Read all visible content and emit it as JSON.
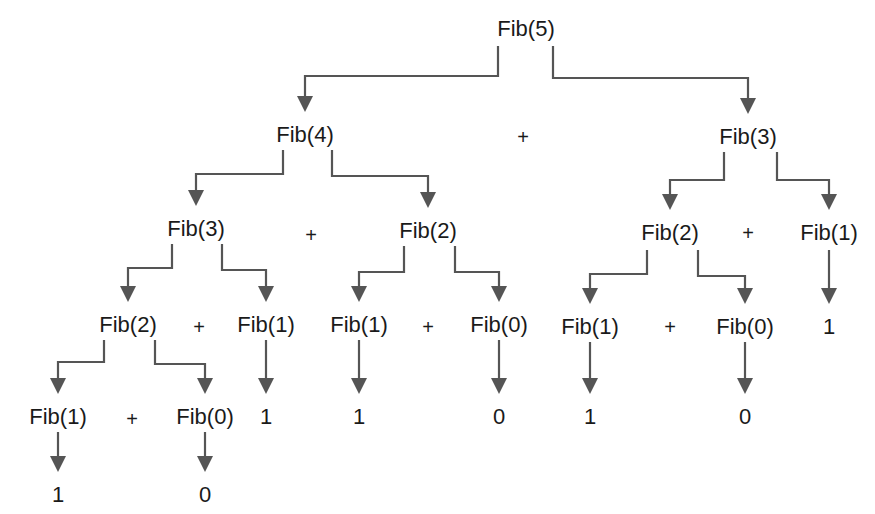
{
  "colors": {
    "text": "#1a1a1a",
    "arrow": "#555555",
    "background": "#ffffff"
  },
  "nodes": [
    {
      "id": "n5",
      "label": "Fib(5)",
      "x": 526,
      "y": 16
    },
    {
      "id": "n4",
      "label": "Fib(4)",
      "x": 305,
      "y": 122
    },
    {
      "id": "n3r",
      "label": "Fib(3)",
      "x": 748,
      "y": 124
    },
    {
      "id": "n3",
      "label": "Fib(3)",
      "x": 196,
      "y": 216
    },
    {
      "id": "n2a",
      "label": "Fib(2)",
      "x": 428,
      "y": 218
    },
    {
      "id": "n2r",
      "label": "Fib(2)",
      "x": 670,
      "y": 220
    },
    {
      "id": "n1r",
      "label": "Fib(1)",
      "x": 829,
      "y": 220
    },
    {
      "id": "n2",
      "label": "Fib(2)",
      "x": 128,
      "y": 312
    },
    {
      "id": "n1a",
      "label": "Fib(1)",
      "x": 266,
      "y": 312
    },
    {
      "id": "n1b",
      "label": "Fib(1)",
      "x": 359,
      "y": 312
    },
    {
      "id": "n0a",
      "label": "Fib(0)",
      "x": 499,
      "y": 312
    },
    {
      "id": "n1c",
      "label": "Fib(1)",
      "x": 590,
      "y": 314
    },
    {
      "id": "n0b",
      "label": "Fib(0)",
      "x": 745,
      "y": 314
    },
    {
      "id": "v1r",
      "label": "1",
      "x": 829,
      "y": 314
    },
    {
      "id": "n1d",
      "label": "Fib(1)",
      "x": 58,
      "y": 404
    },
    {
      "id": "n0c",
      "label": "Fib(0)",
      "x": 205,
      "y": 404
    },
    {
      "id": "v1a",
      "label": "1",
      "x": 266,
      "y": 404
    },
    {
      "id": "v1b",
      "label": "1",
      "x": 359,
      "y": 404
    },
    {
      "id": "v0a",
      "label": "0",
      "x": 499,
      "y": 404
    },
    {
      "id": "v1c",
      "label": "1",
      "x": 590,
      "y": 404
    },
    {
      "id": "v0b",
      "label": "0",
      "x": 745,
      "y": 404
    },
    {
      "id": "v1d",
      "label": "1",
      "x": 58,
      "y": 482
    },
    {
      "id": "v0c",
      "label": "0",
      "x": 205,
      "y": 482
    }
  ],
  "operators": [
    {
      "label": "+",
      "x": 523,
      "y": 124
    },
    {
      "label": "+",
      "x": 311,
      "y": 222
    },
    {
      "label": "+",
      "x": 748,
      "y": 220
    },
    {
      "label": "+",
      "x": 199,
      "y": 314
    },
    {
      "label": "+",
      "x": 428,
      "y": 314
    },
    {
      "label": "+",
      "x": 670,
      "y": 314
    },
    {
      "label": "+",
      "x": 132,
      "y": 406
    }
  ],
  "edges": [
    {
      "from": "n5",
      "to": "n4",
      "points": [
        [
          498,
          46
        ],
        [
          498,
          76
        ],
        [
          305,
          76
        ],
        [
          305,
          112
        ]
      ]
    },
    {
      "from": "n5",
      "to": "n3r",
      "points": [
        [
          553,
          46
        ],
        [
          553,
          78
        ],
        [
          748,
          78
        ],
        [
          748,
          114
        ]
      ]
    },
    {
      "from": "n4",
      "to": "n3",
      "points": [
        [
          283,
          150
        ],
        [
          283,
          174
        ],
        [
          196,
          174
        ],
        [
          196,
          206
        ]
      ]
    },
    {
      "from": "n4",
      "to": "n2a",
      "points": [
        [
          332,
          150
        ],
        [
          332,
          176
        ],
        [
          428,
          176
        ],
        [
          428,
          208
        ]
      ]
    },
    {
      "from": "n3r",
      "to": "n2r",
      "points": [
        [
          724,
          152
        ],
        [
          724,
          180
        ],
        [
          670,
          180
        ],
        [
          670,
          210
        ]
      ]
    },
    {
      "from": "n3r",
      "to": "n1r",
      "points": [
        [
          777,
          152
        ],
        [
          777,
          180
        ],
        [
          829,
          180
        ],
        [
          829,
          210
        ]
      ]
    },
    {
      "from": "n3",
      "to": "n2",
      "points": [
        [
          172,
          244
        ],
        [
          172,
          268
        ],
        [
          128,
          268
        ],
        [
          128,
          302
        ]
      ]
    },
    {
      "from": "n3",
      "to": "n1a",
      "points": [
        [
          222,
          244
        ],
        [
          222,
          270
        ],
        [
          266,
          270
        ],
        [
          266,
          302
        ]
      ]
    },
    {
      "from": "n2a",
      "to": "n1b",
      "points": [
        [
          404,
          246
        ],
        [
          404,
          272
        ],
        [
          359,
          272
        ],
        [
          359,
          302
        ]
      ]
    },
    {
      "from": "n2a",
      "to": "n0a",
      "points": [
        [
          455,
          246
        ],
        [
          455,
          272
        ],
        [
          499,
          272
        ],
        [
          499,
          302
        ]
      ]
    },
    {
      "from": "n2r",
      "to": "n1c",
      "points": [
        [
          647,
          250
        ],
        [
          647,
          274
        ],
        [
          590,
          274
        ],
        [
          590,
          304
        ]
      ]
    },
    {
      "from": "n2r",
      "to": "n0b",
      "points": [
        [
          698,
          250
        ],
        [
          698,
          276
        ],
        [
          745,
          276
        ],
        [
          745,
          304
        ]
      ]
    },
    {
      "from": "n1r",
      "to": "v1r",
      "points": [
        [
          829,
          250
        ],
        [
          829,
          304
        ]
      ]
    },
    {
      "from": "n2",
      "to": "n1d",
      "points": [
        [
          104,
          340
        ],
        [
          104,
          362
        ],
        [
          58,
          362
        ],
        [
          58,
          394
        ]
      ]
    },
    {
      "from": "n2",
      "to": "n0c",
      "points": [
        [
          155,
          340
        ],
        [
          155,
          364
        ],
        [
          205,
          364
        ],
        [
          205,
          394
        ]
      ]
    },
    {
      "from": "n1a",
      "to": "v1a",
      "points": [
        [
          266,
          340
        ],
        [
          266,
          394
        ]
      ]
    },
    {
      "from": "n1b",
      "to": "v1b",
      "points": [
        [
          359,
          340
        ],
        [
          359,
          394
        ]
      ]
    },
    {
      "from": "n0a",
      "to": "v0a",
      "points": [
        [
          499,
          340
        ],
        [
          499,
          394
        ]
      ]
    },
    {
      "from": "n1c",
      "to": "v1c",
      "points": [
        [
          590,
          342
        ],
        [
          590,
          394
        ]
      ]
    },
    {
      "from": "n0b",
      "to": "v0b",
      "points": [
        [
          745,
          342
        ],
        [
          745,
          394
        ]
      ]
    },
    {
      "from": "n1d",
      "to": "v1d",
      "points": [
        [
          58,
          432
        ],
        [
          58,
          472
        ]
      ]
    },
    {
      "from": "n0c",
      "to": "v0c",
      "points": [
        [
          205,
          432
        ],
        [
          205,
          472
        ]
      ]
    }
  ]
}
